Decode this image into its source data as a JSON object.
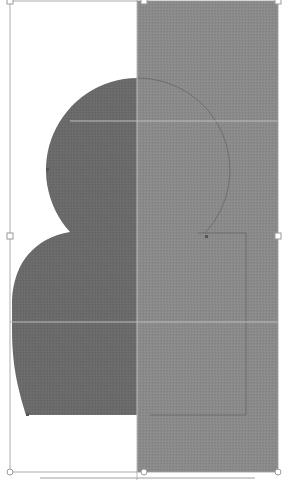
{
  "canvas": {
    "width": 285,
    "height": 480,
    "background": "#ffffff"
  },
  "selection": {
    "bounding_box": {
      "x": 10,
      "y": 1,
      "width": 268,
      "height": 471
    },
    "handle_color": "#9a9a9a",
    "handles": [
      {
        "name": "top-left",
        "x": 10,
        "y": 1
      },
      {
        "name": "top-middle",
        "x": 144,
        "y": 1
      },
      {
        "name": "top-right",
        "x": 278,
        "y": 1
      },
      {
        "name": "middle-left",
        "x": 10,
        "y": 236
      },
      {
        "name": "middle-right",
        "x": 278,
        "y": 236
      },
      {
        "name": "bottom-left",
        "x": 10,
        "y": 472
      },
      {
        "name": "bottom-middle",
        "x": 144,
        "y": 472
      },
      {
        "name": "bottom-right",
        "x": 278,
        "y": 472
      }
    ]
  },
  "shapes": {
    "silhouette": {
      "fill": "#6b6b6b",
      "description": "snowman-like dark grey shape: circle head atop rounded body"
    },
    "rectangle": {
      "fill": "#8c8c8c",
      "x": 137,
      "y": 1,
      "width": 141,
      "height": 471
    },
    "guide_color": "#b8b8b8",
    "path_outline_color": "#5a5a5a"
  },
  "guides": {
    "horizontal": [
      121,
      322
    ],
    "vertical": [
      137
    ]
  }
}
